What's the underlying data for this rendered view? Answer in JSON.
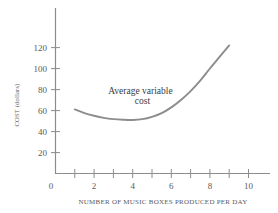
{
  "chart_data": {
    "type": "line",
    "title": "",
    "xlabel": "NUMBER OF MUSIC BOXES PRODUCED PER DAY",
    "ylabel": "COST (dollars)",
    "xlim": [
      0,
      11
    ],
    "ylim": [
      0,
      132
    ],
    "grid": false,
    "legend": "none",
    "x_ticks": [
      0,
      1,
      2,
      3,
      4,
      5,
      6,
      7,
      8,
      9,
      10
    ],
    "x_tick_labels": [
      "0",
      "",
      "2",
      "",
      "4",
      "",
      "6",
      "",
      "8",
      "",
      "10"
    ],
    "y_ticks": [
      20,
      40,
      60,
      80,
      100,
      120
    ],
    "y_tick_labels": [
      "20",
      "40",
      "60",
      "80",
      "100",
      "120"
    ],
    "series": [
      {
        "name": "Average variable cost",
        "color": "#8c8c8c",
        "x": [
          1.0,
          1.5,
          2.0,
          2.5,
          3.0,
          3.5,
          4.0,
          4.5,
          5.0,
          5.5,
          6.0,
          6.5,
          7.0,
          7.5,
          8.0,
          8.5,
          9.0
        ],
        "values": [
          61,
          57.5,
          55,
          53,
          51.8,
          51.2,
          51,
          51.8,
          54,
          57.5,
          63,
          70,
          78.5,
          88.5,
          100,
          111,
          122
        ]
      }
    ],
    "annotations": [
      {
        "text": "Average variable",
        "x": 4.4,
        "y": 76
      },
      {
        "text": "cost",
        "x": 4.5,
        "y": 66
      }
    ]
  },
  "axes": {
    "axis_color": "#8c8c8c",
    "tick_color": "#8c8c8c",
    "label_color": "#5a5a5a"
  },
  "colors": {
    "background": "#ffffff",
    "curve": "#8c8c8c"
  }
}
